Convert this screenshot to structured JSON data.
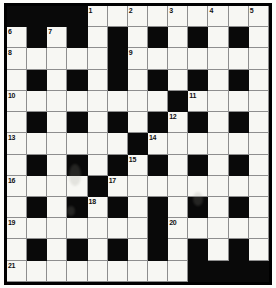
{
  "puzzle": {
    "title": "Crossword Grid",
    "rows": 13,
    "cols": 13,
    "colors": {
      "block": "#090909",
      "cell": "#f7f7f3",
      "grid_line": "#8e8e8e",
      "border": "#000000",
      "number": "#111111"
    },
    "grid": [
      [
        "block",
        "block",
        "block",
        "block",
        "open",
        "open",
        "open",
        "open",
        "open",
        "open",
        "open",
        "open",
        "open"
      ],
      [
        "open",
        "block",
        "open",
        "block",
        "open",
        "block",
        "open",
        "block",
        "open",
        "block",
        "open",
        "block",
        "open"
      ],
      [
        "open",
        "open",
        "open",
        "open",
        "open",
        "block",
        "open",
        "open",
        "open",
        "open",
        "open",
        "open",
        "open"
      ],
      [
        "open",
        "block",
        "open",
        "block",
        "open",
        "block",
        "open",
        "block",
        "open",
        "block",
        "open",
        "block",
        "open"
      ],
      [
        "open",
        "open",
        "open",
        "open",
        "open",
        "open",
        "open",
        "open",
        "block",
        "open",
        "open",
        "open",
        "open"
      ],
      [
        "open",
        "block",
        "open",
        "block",
        "open",
        "block",
        "open",
        "block",
        "open",
        "block",
        "open",
        "block",
        "open"
      ],
      [
        "open",
        "open",
        "open",
        "open",
        "open",
        "open",
        "block",
        "open",
        "open",
        "open",
        "open",
        "open",
        "open"
      ],
      [
        "open",
        "block",
        "open",
        "block",
        "open",
        "block",
        "open",
        "block",
        "open",
        "block",
        "open",
        "block",
        "open"
      ],
      [
        "open",
        "open",
        "open",
        "open",
        "block",
        "open",
        "open",
        "open",
        "open",
        "open",
        "open",
        "open",
        "open"
      ],
      [
        "open",
        "block",
        "open",
        "block",
        "open",
        "block",
        "open",
        "block",
        "open",
        "block",
        "open",
        "block",
        "open"
      ],
      [
        "open",
        "open",
        "open",
        "open",
        "open",
        "open",
        "open",
        "block",
        "open",
        "open",
        "open",
        "open",
        "open"
      ],
      [
        "open",
        "block",
        "open",
        "block",
        "open",
        "block",
        "open",
        "block",
        "open",
        "block",
        "open",
        "block",
        "open"
      ],
      [
        "open",
        "open",
        "open",
        "open",
        "open",
        "open",
        "open",
        "open",
        "open",
        "block",
        "block",
        "block",
        "block"
      ]
    ],
    "numbers": [
      {
        "n": "1",
        "row": 0,
        "col": 4
      },
      {
        "n": "2",
        "row": 0,
        "col": 6
      },
      {
        "n": "3",
        "row": 0,
        "col": 8
      },
      {
        "n": "4",
        "row": 0,
        "col": 10
      },
      {
        "n": "5",
        "row": 0,
        "col": 12
      },
      {
        "n": "6",
        "row": 1,
        "col": 0
      },
      {
        "n": "7",
        "row": 1,
        "col": 2
      },
      {
        "n": "8",
        "row": 2,
        "col": 0
      },
      {
        "n": "9",
        "row": 2,
        "col": 6
      },
      {
        "n": "10",
        "row": 4,
        "col": 0
      },
      {
        "n": "11",
        "row": 4,
        "col": 9
      },
      {
        "n": "12",
        "row": 5,
        "col": 8
      },
      {
        "n": "13",
        "row": 6,
        "col": 0
      },
      {
        "n": "14",
        "row": 6,
        "col": 7
      },
      {
        "n": "15",
        "row": 7,
        "col": 6
      },
      {
        "n": "16",
        "row": 8,
        "col": 0
      },
      {
        "n": "17",
        "row": 8,
        "col": 5
      },
      {
        "n": "18",
        "row": 9,
        "col": 4
      },
      {
        "n": "19",
        "row": 10,
        "col": 0
      },
      {
        "n": "20",
        "row": 10,
        "col": 8
      },
      {
        "n": "21",
        "row": 12,
        "col": 0
      }
    ]
  }
}
